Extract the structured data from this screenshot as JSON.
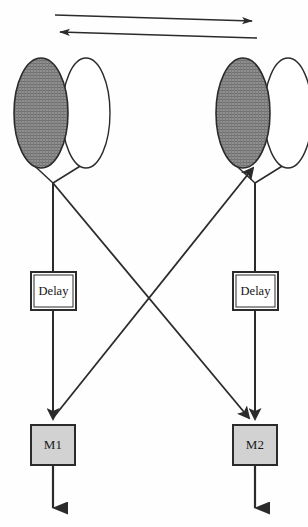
{
  "figure": {
    "caption_fragment": "",
    "top_arrows": [
      {
        "name": "rightward-arrow",
        "direction": "right",
        "x1": 55,
        "y1": 15,
        "x2": 257,
        "y2": 21
      },
      {
        "name": "leftward-arrow",
        "direction": "left",
        "x1": 257,
        "y1": 38,
        "x2": 54,
        "y2": 32
      }
    ],
    "nodes": [
      {
        "id": "left-node",
        "shaded_ellipse": {
          "cx": 41,
          "cy": 113,
          "rx": 27,
          "ry": 55
        },
        "white_ellipse": {
          "cx": 86,
          "cy": 113,
          "rx": 24,
          "ry": 55
        },
        "junction": {
          "x": 53,
          "y": 183
        }
      },
      {
        "id": "right-node",
        "shaded_ellipse": {
          "cx": 243,
          "cy": 113,
          "rx": 27,
          "ry": 55
        },
        "white_ellipse": {
          "cx": 288,
          "cy": 113,
          "rx": 24,
          "ry": 55
        },
        "junction": {
          "x": 255,
          "y": 183
        }
      }
    ],
    "delay_boxes": [
      {
        "id": "delay-left",
        "label": "Delay",
        "x": 31,
        "y": 272,
        "w": 45,
        "h": 38
      },
      {
        "id": "delay-right",
        "label": "Delay",
        "x": 233,
        "y": 272,
        "w": 45,
        "h": 38
      }
    ],
    "memory_boxes": [
      {
        "id": "m1",
        "label": "M1",
        "x": 31,
        "y": 425,
        "w": 44,
        "h": 40,
        "fill": "#d2d2d2"
      },
      {
        "id": "m2",
        "label": "M2",
        "x": 233,
        "y": 425,
        "w": 44,
        "h": 40,
        "fill": "#d2d2d2"
      }
    ],
    "output_arrows": [
      {
        "id": "m1-output",
        "x": 53,
        "y1": 465,
        "y2": 518
      },
      {
        "id": "m2-output",
        "x": 255,
        "y1": 465,
        "y2": 518
      }
    ],
    "cross_point": {
      "x": 154,
      "y": 305
    },
    "colors": {
      "stroke": "#2b2b2b",
      "shaded_fill": "#8a8a8a",
      "white_fill": "#ffffff",
      "box_fill": "#d2d2d2",
      "delay_fill": "#ffffff",
      "background": "#ffffff"
    }
  }
}
